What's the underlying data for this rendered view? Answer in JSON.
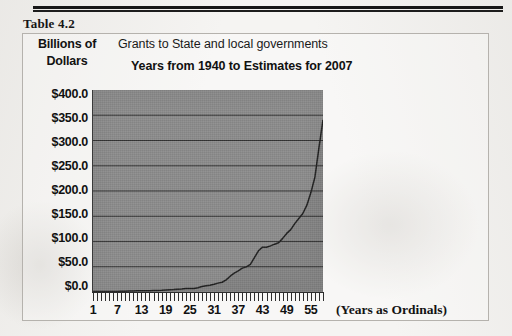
{
  "caption": "Table 4.2",
  "unit_label_line1": "Billions of",
  "unit_label_line2": "Dollars",
  "title_line1": "Grants to State and local governments",
  "title_line2": "Years from 1940 to Estimates for 2007",
  "x_axis_title": "(Years as Ordinals)",
  "colors": {
    "plot_fill": "#8b8b8b",
    "line": "#1e1e1e",
    "gridline": "#333333",
    "text": "#111111",
    "page": "#f5f4f2",
    "box_border": "#b5b2ad"
  },
  "chart_data": {
    "type": "area",
    "title": "Grants to State and local governments",
    "subtitle": "Years from 1940 to Estimates for 2007",
    "xlabel": "(Years as Ordinals)",
    "ylabel": "Billions of Dollars",
    "ylim": [
      0,
      400
    ],
    "xlim": [
      1,
      58
    ],
    "grid": true,
    "legend": "none",
    "ytick_labels": [
      "$400.0",
      "$350.0",
      "$300.0",
      "$250.0",
      "$200.0",
      "$150.0",
      "$100.0",
      "$50.0",
      "$0.0"
    ],
    "ytick_values": [
      400,
      350,
      300,
      250,
      200,
      150,
      100,
      50,
      0
    ],
    "xtick_labels": [
      "1",
      "7",
      "13",
      "19",
      "25",
      "31",
      "37",
      "43",
      "49",
      "55"
    ],
    "xtick_values": [
      1,
      7,
      13,
      19,
      25,
      31,
      37,
      43,
      49,
      55
    ],
    "x": [
      1,
      2,
      3,
      4,
      5,
      6,
      7,
      8,
      9,
      10,
      11,
      12,
      13,
      14,
      15,
      16,
      17,
      18,
      19,
      20,
      21,
      22,
      23,
      24,
      25,
      26,
      27,
      28,
      29,
      30,
      31,
      32,
      33,
      34,
      35,
      36,
      37,
      38,
      39,
      40,
      41,
      42,
      43,
      44,
      45,
      46,
      47,
      48,
      49,
      50,
      51,
      52,
      53,
      54,
      55,
      56,
      57,
      58
    ],
    "values": [
      0.9,
      0.9,
      0.9,
      1.0,
      1.0,
      0.9,
      1.1,
      1.3,
      1.6,
      1.9,
      2.2,
      2.3,
      2.4,
      2.5,
      2.7,
      3.0,
      3.1,
      3.4,
      4.0,
      4.6,
      4.9,
      5.4,
      6.0,
      6.8,
      7.0,
      7.1,
      8.6,
      10.9,
      12.4,
      13.4,
      15.2,
      17.6,
      19.3,
      24.1,
      31.3,
      37.2,
      42.0,
      47.3,
      49.8,
      54.6,
      68.1,
      81.6,
      88.8,
      88.6,
      91.4,
      94.7,
      97.6,
      106.2,
      116.0,
      123.5,
      135.4,
      145.7,
      155.5,
      171.9,
      196.9,
      227.8,
      285.9,
      341.0
    ]
  }
}
